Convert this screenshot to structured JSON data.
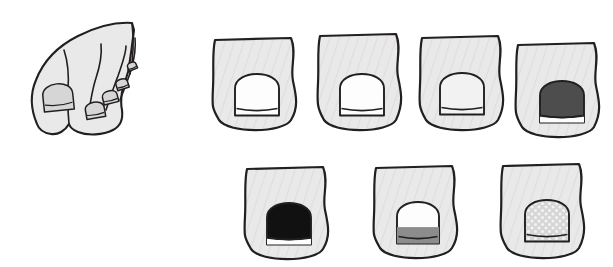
{
  "figure": {
    "background_color": "#ffffff",
    "palette": {
      "outline": "#231f20",
      "toe_fill": "#e9e9e9",
      "toe_fill_shade": "#dedede",
      "nail_white": "#fdfdfd",
      "nail_light_gray": "#d6d6d6",
      "nail_mid_gray": "#8c8c8c",
      "nail_dark_gray": "#4d4d4d",
      "nail_black": "#111111",
      "speckle_dot": "#f4f4f4"
    },
    "foot": {
      "label": "foot-with-five-toes",
      "description": "Line drawing of a foot seen from above-front showing five toenails",
      "nail_count": 5,
      "nails": [
        {
          "index": 1,
          "name": "great-toe-nail",
          "fill": "#d6d6d6",
          "condition": "normal"
        },
        {
          "index": 2,
          "name": "second-toe-nail",
          "fill": "#d6d6d6",
          "condition": "normal"
        },
        {
          "index": 3,
          "name": "third-toe-nail",
          "fill": "#d6d6d6",
          "condition": "normal"
        },
        {
          "index": 4,
          "name": "fourth-toe-nail",
          "fill": "#d6d6d6",
          "condition": "normal"
        },
        {
          "index": 5,
          "name": "fifth-toe-nail",
          "fill": "#d6d6d6",
          "condition": "normal"
        }
      ]
    },
    "rows": [
      {
        "name": "top-row",
        "toes": [
          {
            "id": "toe-1",
            "name": "toe-normal-pale-1",
            "nail_fill": "#fdfdfd",
            "nail_pattern": "plain",
            "x": 207,
            "y": 37,
            "width": 96,
            "height": 99,
            "nail_cx": 50,
            "nail_cy": 58,
            "nail_w": 44,
            "nail_h": 41,
            "flip": false
          },
          {
            "id": "toe-2",
            "name": "toe-normal-pale-2",
            "nail_fill": "#fdfdfd",
            "nail_pattern": "plain",
            "x": 312,
            "y": 33,
            "width": 96,
            "height": 103,
            "nail_cx": 50,
            "nail_cy": 62,
            "nail_w": 44,
            "nail_h": 41,
            "flip": false
          },
          {
            "id": "toe-3",
            "name": "toe-normal-pale-3",
            "nail_fill": "#f2f2f2",
            "nail_pattern": "plain",
            "x": 414,
            "y": 35,
            "width": 96,
            "height": 101,
            "nail_cx": 48,
            "nail_cy": 59,
            "nail_w": 44,
            "nail_h": 41,
            "flip": false
          },
          {
            "id": "toe-4",
            "name": "toe-dark-gray-nail",
            "nail_fill": "#4d4d4d",
            "nail_pattern": "plain",
            "x": 510,
            "y": 42,
            "width": 96,
            "height": 101,
            "nail_cx": 52,
            "nail_cy": 60,
            "nail_w": 44,
            "nail_h": 41,
            "flip": false
          }
        ]
      },
      {
        "name": "bottom-row",
        "toes": [
          {
            "id": "toe-5",
            "name": "toe-black-nail",
            "nail_fill": "#111111",
            "nail_pattern": "plain",
            "x": 239,
            "y": 166,
            "width": 96,
            "height": 99,
            "nail_cx": 50,
            "nail_cy": 58,
            "nail_w": 44,
            "nail_h": 41,
            "flip": false
          },
          {
            "id": "toe-6",
            "name": "toe-gray-band-nail",
            "nail_fill": "#fdfdfd",
            "nail_pattern": "band",
            "band_fill": "#8c8c8c",
            "x": 368,
            "y": 165,
            "width": 96,
            "height": 99,
            "nail_cx": 50,
            "nail_cy": 58,
            "nail_w": 42,
            "nail_h": 41,
            "flip": false
          },
          {
            "id": "toe-7",
            "name": "toe-speckled-nail",
            "nail_fill": "#d6d6d6",
            "nail_pattern": "speckled",
            "x": 495,
            "y": 163,
            "width": 96,
            "height": 101,
            "nail_cx": 52,
            "nail_cy": 58,
            "nail_w": 44,
            "nail_h": 41,
            "flip": false
          }
        ]
      }
    ]
  }
}
